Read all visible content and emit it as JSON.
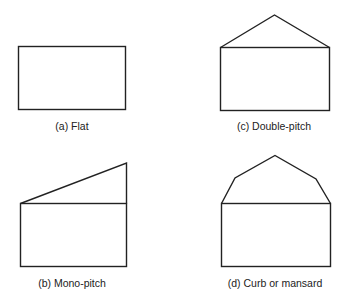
{
  "figures": [
    {
      "id": "a",
      "label": "(a) Flat",
      "roof_type": "flat"
    },
    {
      "id": "c",
      "label": "(c) Double-pitch",
      "roof_type": "double-pitch"
    },
    {
      "id": "b",
      "label": "(b) Mono-pitch",
      "roof_type": "mono-pitch"
    },
    {
      "id": "d",
      "label": "(d) Curb or mansard",
      "roof_type": "curb-or-mansard"
    }
  ],
  "colors": {
    "stroke": "#222222",
    "background": "#ffffff"
  }
}
